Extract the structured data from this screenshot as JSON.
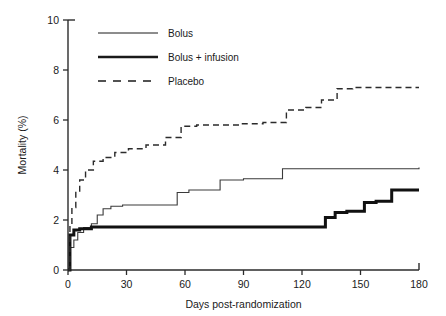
{
  "chart_data": {
    "type": "line",
    "title": "",
    "xlabel": "Days post-randomization",
    "ylabel": "Mortality (%)",
    "xlim": [
      0,
      180
    ],
    "ylim": [
      0,
      10
    ],
    "xticks": [
      0,
      30,
      60,
      90,
      120,
      150,
      180
    ],
    "xtick_labels": [
      "0",
      "30",
      "60",
      "90",
      "120",
      "150",
      "180"
    ],
    "yticks": [
      0,
      2,
      4,
      6,
      8,
      10
    ],
    "ytick_labels": [
      "0",
      "2",
      "4",
      "6",
      "8",
      "10"
    ],
    "grid": false,
    "legend_position": "top-left",
    "step_type": "post",
    "series": [
      {
        "name": "Bolus",
        "style": "thin-solid",
        "color": "#3a3a3a",
        "x": [
          0,
          1,
          3,
          5,
          8,
          12,
          15,
          18,
          22,
          28,
          34,
          41,
          48,
          56,
          62,
          70,
          78,
          90,
          110,
          130,
          150,
          170,
          180
        ],
        "y": [
          0,
          0.9,
          1.2,
          1.5,
          1.7,
          1.85,
          2.2,
          2.45,
          2.55,
          2.6,
          2.6,
          2.6,
          2.6,
          3.1,
          3.2,
          3.2,
          3.6,
          3.65,
          4.05,
          4.05,
          4.05,
          4.05,
          4.1
        ]
      },
      {
        "name": "Bolus + infusion",
        "style": "thick-solid",
        "color": "#111111",
        "x": [
          0,
          1,
          3,
          6,
          12,
          20,
          40,
          60,
          80,
          100,
          120,
          128,
          132,
          137,
          143,
          152,
          158,
          166,
          180
        ],
        "y": [
          0,
          1.4,
          1.6,
          1.65,
          1.72,
          1.72,
          1.72,
          1.72,
          1.72,
          1.72,
          1.72,
          1.72,
          2.1,
          2.3,
          2.35,
          2.7,
          2.75,
          3.2,
          3.2
        ]
      },
      {
        "name": "Placebo",
        "style": "dashed",
        "color": "#2b2b2b",
        "x": [
          0,
          1,
          2,
          4,
          6,
          9,
          13,
          18,
          24,
          31,
          40,
          50,
          58,
          66,
          76,
          88,
          100,
          112,
          122,
          130,
          138,
          146,
          156,
          168,
          180
        ],
        "y": [
          0,
          1.8,
          2.5,
          3.1,
          3.6,
          4.0,
          4.35,
          4.5,
          4.7,
          4.85,
          5.0,
          5.3,
          5.75,
          5.8,
          5.8,
          5.85,
          5.9,
          6.4,
          6.5,
          6.8,
          7.25,
          7.3,
          7.3,
          7.3,
          7.3
        ]
      }
    ]
  },
  "legend": {
    "items": [
      {
        "label": "Bolus",
        "style": "thin-solid"
      },
      {
        "label": "Bolus + infusion",
        "style": "thick-solid"
      },
      {
        "label": "Placebo",
        "style": "dashed"
      }
    ]
  },
  "axes": {
    "x_title": "Days post-randomization",
    "y_title": "Mortality (%)"
  },
  "colors": {
    "axis": "#2b2b2b",
    "text": "#1a1a1a",
    "background": "#ffffff"
  }
}
